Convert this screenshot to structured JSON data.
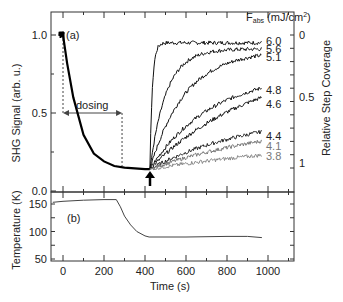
{
  "chart_data": [
    {
      "type": "line",
      "panel": "(a)",
      "title": "",
      "xlabel": "Time (s)",
      "ylabel": "SHG Signal (arb. u.)",
      "ylabel_right": "Relative Step Coverage",
      "xlim": [
        -50,
        1100
      ],
      "ylim": [
        0.0,
        1.1
      ],
      "yticks": [
        0.0,
        0.5,
        1.0
      ],
      "yticks_right": [
        {
          "label": "0",
          "at": 0.96
        },
        {
          "label": "0.5",
          "at": 0.55
        },
        {
          "label": "1",
          "at": 0.14
        }
      ],
      "legend_title": "F_abs (mJ/cm²)",
      "annotations": [
        {
          "text": "dosing",
          "from_t": 0,
          "to_t": 288,
          "y": 0.5
        },
        {
          "text": "arrow",
          "t": 424,
          "note": "laser irradiation start"
        }
      ],
      "grid": false,
      "decay": {
        "t": [
          -20,
          0,
          20,
          50,
          100,
          150,
          200,
          250,
          300,
          350,
          400,
          424
        ],
        "values": [
          1.0,
          1.0,
          0.82,
          0.6,
          0.36,
          0.24,
          0.19,
          0.16,
          0.15,
          0.145,
          0.14,
          0.14
        ]
      },
      "series": [
        {
          "name": "6.0",
          "final": 0.95,
          "tau": 12,
          "color": "#111111"
        },
        {
          "name": "5.6",
          "final": 0.91,
          "tau": 80,
          "color": "#111111"
        },
        {
          "name": "5.1",
          "final": 0.87,
          "tau": 170,
          "color": "#111111"
        },
        {
          "name": "4.8",
          "final": 0.66,
          "tau": 300,
          "color": "#111111"
        },
        {
          "name": "4.6",
          "final": 0.6,
          "tau": 500,
          "color": "#111111"
        },
        {
          "name": "4.4",
          "final": 0.38,
          "tau": 500,
          "color": "#222222"
        },
        {
          "name": "4.1",
          "final": 0.32,
          "tau": 700,
          "color": "#777777"
        },
        {
          "name": "3.8",
          "final": 0.23,
          "tau": 900,
          "color": "#888888"
        }
      ]
    },
    {
      "type": "line",
      "panel": "(b)",
      "xlabel": "Time (s)",
      "ylabel": "Temperature (K)",
      "xlim": [
        -50,
        1100
      ],
      "ylim": [
        50,
        170
      ],
      "xticks": [
        0,
        200,
        400,
        600,
        800,
        1000
      ],
      "yticks": [
        50,
        100,
        150
      ],
      "series": [
        {
          "name": "Temperature",
          "t": [
            -50,
            0,
            100,
            200,
            260,
            280,
            300,
            330,
            360,
            400,
            420,
            600,
            800,
            900,
            970
          ],
          "values": [
            153,
            155,
            157,
            158,
            158,
            145,
            128,
            112,
            100,
            92,
            90,
            90,
            91,
            91,
            89
          ]
        }
      ]
    }
  ],
  "labels": {
    "panel_a": "(a)",
    "panel_b": "(b)",
    "dosing": "dosing",
    "legend_title_main": "F",
    "legend_title_sub": "abs",
    "legend_title_unit": " (mJ/cm",
    "legend_title_sup": "2",
    "legend_title_close": ")",
    "ylabel_left_top": "SHG Signal (arb. u.)",
    "ylabel_right": "Relative Step Coverage",
    "ylabel_left_bottom": "Temperature (K)",
    "xlabel": "Time (s)",
    "ytick_a": [
      "0.0",
      "0.5",
      "1.0"
    ],
    "ytick_right": [
      "0",
      "0.5",
      "1"
    ],
    "ytick_b": [
      "50",
      "100",
      "150"
    ],
    "xtick": [
      "0",
      "200",
      "400",
      "600",
      "800",
      "1000"
    ]
  }
}
